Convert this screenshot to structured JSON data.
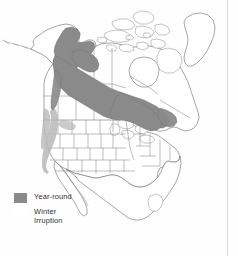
{
  "figure": {
    "name": "north-america-range-map",
    "background": "#fefefe",
    "outline_color": "#6d6d6d",
    "border_rule_color": "#d8d8d8"
  },
  "legend": {
    "items": [
      {
        "label": "Year-round",
        "color": "#8a8a8a",
        "swatch": "filled"
      },
      {
        "label": "Winter\nIrruption",
        "color": "#ffffff",
        "swatch": "blank"
      }
    ]
  },
  "map_data": {
    "type": "choropleth-range-map",
    "region": "North America",
    "projection": "conic",
    "categories": [
      "Year-round",
      "Winter Irruption"
    ],
    "colors": {
      "Year-round": "#8a8a8a",
      "Winter Irruption": "#b9b9b9",
      "land": "#ffffff"
    },
    "features": [
      "Alaska",
      "Canada",
      "Greenland",
      "United States",
      "Mexico",
      "Canadian Arctic Archipelago",
      "Great Lakes",
      "Hudson Bay",
      "Baja California"
    ],
    "range_year_round_extent": "Interior and southeast Alaska east across boreal Canada to Quebec and the Great Lakes",
    "range_winter_extent": "Narrow strip south along the Pacific coast ranges and northern Rockies"
  }
}
